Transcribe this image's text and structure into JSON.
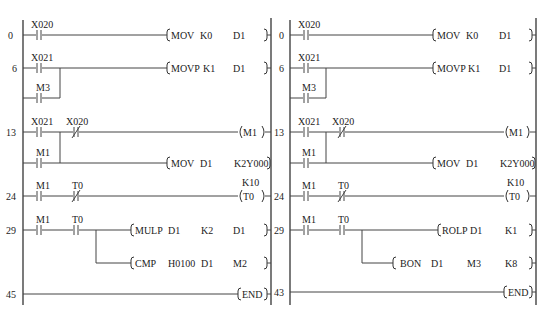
{
  "diagrams": [
    {
      "id": "left",
      "rungs": [
        {
          "step": "0",
          "contacts": [
            {
              "label": "X020",
              "type": "NO"
            }
          ],
          "instruction": {
            "op": "MOV",
            "args": [
              "K0",
              "D1"
            ]
          }
        },
        {
          "step": "6",
          "contacts": [
            {
              "label": "X021",
              "type": "NO"
            }
          ],
          "parallel": [
            {
              "label": "M3",
              "type": "NO"
            }
          ],
          "instruction": {
            "op": "MOVP",
            "args": [
              "K1",
              "D1"
            ]
          }
        },
        {
          "step": "13",
          "contacts": [
            {
              "label": "X021",
              "type": "NO"
            },
            {
              "label": "X020",
              "type": "NC"
            }
          ],
          "parallel": [
            {
              "label": "M1",
              "type": "NO"
            }
          ],
          "coil": {
            "label": "M1"
          },
          "branch_instruction": {
            "op": "MOV",
            "args": [
              "D1",
              "K2Y000"
            ]
          }
        },
        {
          "step": "24",
          "contacts": [
            {
              "label": "M1",
              "type": "NO"
            },
            {
              "label": "T0",
              "type": "NC"
            }
          ],
          "coil": {
            "label": "T0",
            "setting": "K10"
          }
        },
        {
          "step": "29",
          "contacts": [
            {
              "label": "M1",
              "type": "NO"
            },
            {
              "label": "T0",
              "type": "NO"
            }
          ],
          "instruction": {
            "op": "MULP",
            "args": [
              "D1",
              "K2",
              "D1"
            ]
          },
          "branch_instruction": {
            "op": "CMP",
            "args": [
              "H0100",
              "D1",
              "M2"
            ]
          }
        },
        {
          "step": "45",
          "instruction": {
            "op": "END",
            "args": []
          }
        }
      ]
    },
    {
      "id": "right",
      "rungs": [
        {
          "step": "0",
          "contacts": [
            {
              "label": "X020",
              "type": "NO"
            }
          ],
          "instruction": {
            "op": "MOV",
            "args": [
              "K0",
              "D1"
            ]
          }
        },
        {
          "step": "6",
          "contacts": [
            {
              "label": "X021",
              "type": "NO"
            }
          ],
          "parallel": [
            {
              "label": "M3",
              "type": "NO"
            }
          ],
          "instruction": {
            "op": "MOVP",
            "args": [
              "K1",
              "D1"
            ]
          }
        },
        {
          "step": "13",
          "contacts": [
            {
              "label": "X021",
              "type": "NO"
            },
            {
              "label": "X020",
              "type": "NC"
            }
          ],
          "parallel": [
            {
              "label": "M1",
              "type": "NO"
            }
          ],
          "coil": {
            "label": "M1"
          },
          "branch_instruction": {
            "op": "MOV",
            "args": [
              "D1",
              "K2Y000"
            ]
          }
        },
        {
          "step": "24",
          "contacts": [
            {
              "label": "M1",
              "type": "NO"
            },
            {
              "label": "T0",
              "type": "NC"
            }
          ],
          "coil": {
            "label": "T0",
            "setting": "K10"
          }
        },
        {
          "step": "29",
          "contacts": [
            {
              "label": "M1",
              "type": "NO"
            },
            {
              "label": "T0",
              "type": "NO"
            }
          ],
          "instruction": {
            "op": "ROLP",
            "args": [
              "D1",
              "K1"
            ]
          },
          "branch_instruction": {
            "op": "BON",
            "args": [
              "D1",
              "M3",
              "K8"
            ]
          }
        },
        {
          "step": "43",
          "instruction": {
            "op": "END",
            "args": []
          }
        }
      ]
    }
  ]
}
